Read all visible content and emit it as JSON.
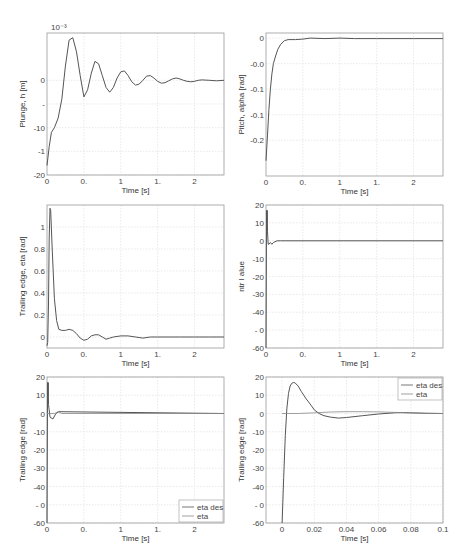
{
  "page": {
    "header_text": "",
    "page_number": "333"
  },
  "chart_data": [
    {
      "id": "plunge",
      "type": "line",
      "title": "",
      "xlabel": "Time [s]",
      "ylabel": "Plunge, h [m]",
      "exponent_label": "10⁻³",
      "box": [
        47,
        33,
        224,
        175
      ],
      "xlim": [
        0,
        2.4
      ],
      "ylim": [
        -20,
        10
      ],
      "xticks": [
        0,
        0.5,
        1,
        1.5,
        2
      ],
      "xtick_labels": [
        "0",
        "0.",
        "1",
        "1.",
        "2"
      ],
      "yticks": [
        -20,
        -15,
        -10,
        -5,
        0
      ],
      "ytick_labels": [
        "-20",
        "-1",
        "-10",
        "-",
        "0"
      ],
      "series": [
        {
          "name": "h",
          "x": [
            0,
            0.03,
            0.06,
            0.1,
            0.15,
            0.2,
            0.25,
            0.3,
            0.35,
            0.4,
            0.45,
            0.5,
            0.55,
            0.6,
            0.65,
            0.7,
            0.75,
            0.8,
            0.85,
            0.9,
            0.95,
            1.0,
            1.05,
            1.1,
            1.15,
            1.2,
            1.25,
            1.3,
            1.35,
            1.4,
            1.45,
            1.5,
            1.55,
            1.6,
            1.65,
            1.7,
            1.75,
            1.8,
            1.85,
            1.9,
            1.95,
            2.0,
            2.05,
            2.1,
            2.2,
            2.3,
            2.4
          ],
          "y": [
            -18,
            -14,
            -11,
            -10,
            -8,
            -4,
            3,
            8.5,
            9,
            6,
            1,
            -3.5,
            -2,
            1.5,
            4,
            3.5,
            1,
            -1.5,
            -2.5,
            -1.5,
            0.5,
            1.8,
            2,
            1,
            -0.3,
            -1,
            -0.8,
            0,
            0.9,
            1,
            0.5,
            -0.2,
            -0.6,
            -0.5,
            -0.1,
            0.3,
            0.5,
            0.3,
            0,
            -0.2,
            -0.3,
            -0.2,
            0,
            0.1,
            0,
            -0.1,
            0
          ]
        }
      ]
    },
    {
      "id": "pitch",
      "type": "line",
      "xlabel": "Time [s]",
      "ylabel": "Pitch, alpha [rad]",
      "box": [
        266,
        33,
        443,
        176
      ],
      "xlim": [
        0,
        2.4
      ],
      "ylim": [
        -0.27,
        0.01
      ],
      "xticks": [
        0,
        0.5,
        1,
        1.5,
        2
      ],
      "xtick_labels": [
        "0",
        "0.",
        "1",
        "1.",
        "2"
      ],
      "yticks": [
        -0.2,
        -0.15,
        -0.1,
        -0.05,
        0
      ],
      "ytick_labels": [
        "-0.2",
        "-0.1",
        "-0.1",
        "-0.0",
        "0"
      ],
      "series": [
        {
          "name": "alpha",
          "x": [
            0,
            0.02,
            0.04,
            0.06,
            0.08,
            0.1,
            0.13,
            0.16,
            0.2,
            0.25,
            0.3,
            0.4,
            0.5,
            0.6,
            0.8,
            1.0,
            1.2,
            1.5,
            2.0,
            2.4
          ],
          "y": [
            -0.24,
            -0.19,
            -0.14,
            -0.1,
            -0.07,
            -0.05,
            -0.035,
            -0.022,
            -0.012,
            -0.005,
            -0.003,
            -0.003,
            -0.002,
            0.0,
            -0.001,
            0.0,
            -0.001,
            -0.001,
            -0.001,
            -0.001
          ]
        }
      ]
    },
    {
      "id": "trailing-edge-eta",
      "type": "line",
      "xlabel": "Time [s]",
      "ylabel": "Trailing edge,  eta [rad]",
      "box": [
        47,
        205,
        224,
        348
      ],
      "xlim": [
        0,
        2.4
      ],
      "ylim": [
        -0.1,
        1.2
      ],
      "xticks": [
        0,
        0.5,
        1,
        1.5,
        2
      ],
      "xtick_labels": [
        "0",
        "0.",
        "1",
        "1.",
        "2"
      ],
      "yticks": [
        0,
        0.2,
        0.4,
        0.6,
        0.8,
        1
      ],
      "ytick_labels": [
        "0",
        "0.2",
        "0.4",
        "0.6",
        "0.8",
        "1"
      ],
      "series": [
        {
          "name": "eta",
          "x": [
            0,
            0.01,
            0.02,
            0.03,
            0.04,
            0.05,
            0.07,
            0.1,
            0.13,
            0.16,
            0.2,
            0.25,
            0.3,
            0.35,
            0.4,
            0.45,
            0.5,
            0.55,
            0.6,
            0.65,
            0.7,
            0.75,
            0.8,
            0.85,
            0.9,
            1.0,
            1.1,
            1.2,
            1.3,
            1.4,
            1.5,
            1.6,
            1.8,
            2.0,
            2.2,
            2.4
          ],
          "y": [
            -0.08,
            -0.05,
            0.3,
            0.9,
            1.17,
            1.15,
            0.8,
            0.35,
            0.15,
            0.07,
            0.06,
            0.06,
            0.07,
            0.06,
            0.03,
            -0.01,
            -0.03,
            -0.02,
            0.01,
            0.02,
            0.02,
            0.0,
            -0.02,
            -0.01,
            0.0,
            0.01,
            0.01,
            0.0,
            -0.01,
            0.0,
            0.0,
            0.0,
            0.0,
            0.0,
            0.0,
            0.0
          ]
        }
      ]
    },
    {
      "id": "control-value",
      "type": "line",
      "xlabel": "Time [s]",
      "ylabel": "ntr l alue",
      "box": [
        266,
        205,
        443,
        348
      ],
      "xlim": [
        0,
        2.4
      ],
      "ylim": [
        -60,
        20
      ],
      "xticks": [
        0,
        0.5,
        1,
        1.5,
        2
      ],
      "xtick_labels": [
        "0",
        "0.",
        "1",
        "1.",
        "2"
      ],
      "yticks": [
        -60,
        -50,
        -40,
        -30,
        -20,
        -10,
        0,
        10,
        20
      ],
      "ytick_labels": [
        "-60",
        "- 0",
        "-40",
        "-30",
        "-20",
        "-10",
        "0",
        "10",
        "20"
      ],
      "series": [
        {
          "name": "u",
          "x": [
            0,
            0.004,
            0.008,
            0.012,
            0.016,
            0.02,
            0.03,
            0.04,
            0.06,
            0.08,
            0.1,
            0.15,
            0.2,
            2.4
          ],
          "y": [
            -60,
            -20,
            17,
            10,
            17,
            5,
            -2,
            -2,
            -1,
            -2,
            -1,
            0,
            0,
            0
          ]
        }
      ]
    },
    {
      "id": "trailing-edge-compare",
      "type": "line",
      "xlabel": "Time [s]",
      "ylabel": "Trailing edge [rad]",
      "box": [
        47,
        377,
        224,
        523
      ],
      "xlim": [
        0,
        2.4
      ],
      "ylim": [
        -60,
        20
      ],
      "xticks": [
        0,
        0.5,
        1,
        1.5,
        2
      ],
      "xtick_labels": [
        "0",
        "0.",
        "1",
        "1.",
        "2"
      ],
      "yticks": [
        -60,
        -50,
        -40,
        -30,
        -20,
        -10,
        0,
        10,
        20
      ],
      "ytick_labels": [
        "-60",
        "- 0",
        "-40",
        "-30",
        "-20",
        "-10",
        "0",
        "10",
        "20"
      ],
      "legend": {
        "position": "lower right",
        "entries": [
          "eta des",
          "eta"
        ]
      },
      "series": [
        {
          "name": "eta des",
          "x": [
            0,
            0.004,
            0.008,
            0.012,
            0.016,
            0.02,
            0.04,
            0.08,
            0.12,
            0.16,
            2.4
          ],
          "y": [
            -60,
            -20,
            17,
            10,
            17,
            5,
            -2,
            -3,
            0,
            1,
            0
          ]
        },
        {
          "name": "eta",
          "x": [
            0,
            0.1,
            0.15,
            0.2,
            2.4
          ],
          "y": [
            0,
            0,
            1,
            0,
            0
          ]
        }
      ]
    },
    {
      "id": "trailing-edge-zoom",
      "type": "line",
      "xlabel": "Time [s]",
      "ylabel": "Trailing edge [rad]",
      "box": [
        266,
        377,
        443,
        523
      ],
      "xlim": [
        -0.01,
        0.1
      ],
      "ylim": [
        -60,
        20
      ],
      "xticks": [
        0,
        0.02,
        0.04,
        0.06,
        0.08,
        0.1
      ],
      "xtick_labels": [
        "0",
        "0.02",
        "0.04",
        "0.06",
        "0.08",
        "0.1"
      ],
      "extra_xtick": {
        "value": 0.1,
        "label": "0.1"
      },
      "yticks": [
        -60,
        -50,
        -40,
        -30,
        -20,
        -10,
        0,
        10,
        20
      ],
      "ytick_labels": [
        "-60",
        "- 0",
        "-40",
        "-30",
        "-20",
        "-10",
        "0",
        "10",
        "20"
      ],
      "legend": {
        "position": "upper right",
        "entries": [
          "eta des",
          "eta"
        ]
      },
      "series": [
        {
          "name": "eta des",
          "x": [
            0,
            0.001,
            0.002,
            0.003,
            0.004,
            0.005,
            0.006,
            0.007,
            0.008,
            0.01,
            0.012,
            0.015,
            0.018,
            0.02,
            0.023,
            0.026,
            0.03,
            0.035,
            0.04,
            0.05,
            0.06,
            0.07,
            0.075,
            0.08,
            0.09,
            0.1
          ],
          "y": [
            -60,
            -35,
            -12,
            3,
            11,
            15,
            16.5,
            17,
            16.8,
            15,
            12,
            8,
            4.5,
            2,
            0,
            -1.2,
            -2,
            -2.5,
            -2.2,
            -1.2,
            -0.3,
            0.4,
            0.5,
            0.4,
            0.1,
            0
          ]
        },
        {
          "name": "eta",
          "x": [
            0,
            0.01,
            0.02,
            0.03,
            0.04,
            0.05,
            0.06,
            0.07,
            0.08,
            0.09,
            0.1
          ],
          "y": [
            0,
            0,
            0.4,
            0.8,
            1.0,
            1.0,
            0.9,
            0.6,
            0.3,
            0.1,
            0
          ]
        }
      ]
    }
  ]
}
